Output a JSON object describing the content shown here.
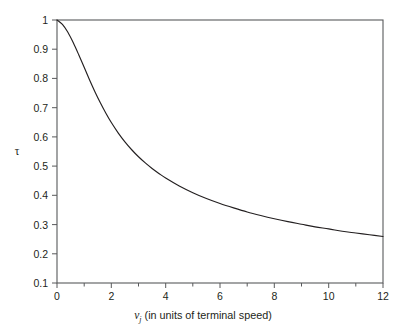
{
  "chart_data": {
    "type": "line",
    "title": "",
    "subtitle": "",
    "xlabel_var": "v",
    "xlabel_sub": "j",
    "xlabel_rest": " (in units of terminal speed)",
    "xlabel": "v_j (in units of terminal speed)",
    "ylabel": "τ",
    "xlim": [
      0,
      12
    ],
    "ylim": [
      0.1,
      1.0
    ],
    "grid": false,
    "legend": "none",
    "xticks": [
      0,
      2,
      4,
      6,
      8,
      10,
      12
    ],
    "xticklabels": [
      "0",
      "2",
      "4",
      "6",
      "8",
      "10",
      "12"
    ],
    "xminorticks": [
      1,
      3,
      5,
      7,
      9,
      11
    ],
    "yticks": [
      0.1,
      0.2,
      0.3,
      0.4,
      0.5,
      0.6,
      0.7,
      0.8,
      0.9,
      1
    ],
    "yticklabels": [
      "0.1",
      "0.2",
      "0.3",
      "0.4",
      "0.5",
      "0.6",
      "0.7",
      "0.8",
      "0.9",
      "1"
    ],
    "series": [
      {
        "name": "tau",
        "color": "#231f20",
        "x": [
          0,
          0.2,
          0.4,
          0.6,
          0.8,
          1.0,
          1.2,
          1.4,
          1.6,
          1.8,
          2.0,
          2.25,
          2.5,
          2.75,
          3.0,
          3.25,
          3.5,
          3.75,
          4.0,
          4.5,
          5.0,
          5.5,
          6.0,
          6.5,
          7.0,
          7.5,
          8.0,
          8.5,
          9.0,
          9.5,
          10.0,
          10.5,
          11.0,
          11.5,
          12.0
        ],
        "y": [
          1.0,
          0.985,
          0.958,
          0.922,
          0.881,
          0.838,
          0.795,
          0.754,
          0.716,
          0.681,
          0.649,
          0.614,
          0.583,
          0.556,
          0.532,
          0.511,
          0.492,
          0.475,
          0.459,
          0.432,
          0.409,
          0.389,
          0.372,
          0.357,
          0.343,
          0.331,
          0.32,
          0.31,
          0.301,
          0.292,
          0.285,
          0.277,
          0.271,
          0.265,
          0.259
        ]
      }
    ],
    "axis_color": "#58595b",
    "background": "#ffffff"
  },
  "figure": {
    "plot_left_px": 57,
    "plot_right_px": 383,
    "plot_top_px": 20,
    "plot_bottom_px": 283
  }
}
